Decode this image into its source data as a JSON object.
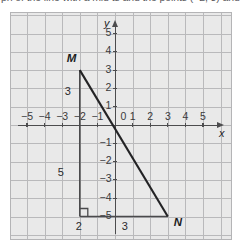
{
  "prompt": {
    "text_visible_fragment": "ph of the line with a mid ts and the points (−2, 3) and (3, −5)"
  },
  "figure": {
    "type": "coordinate-grid-graph",
    "colors": {
      "panel_background": "#e9e9e9",
      "gridline": "#b9b9bb",
      "axis": "#4c4c4e",
      "segment_hypotenuse": "#232325",
      "segment_leg": "#4a4a4c",
      "text": "#2b2b2d"
    },
    "axes": {
      "x_axis_name": "x",
      "y_axis_name": "y",
      "origin_label": "0",
      "x_tick_labels": [
        "−5",
        "−4",
        "−3",
        "−2",
        "−1",
        "1",
        "2",
        "3",
        "4",
        "5"
      ],
      "x_tick_values": [
        -5,
        -4,
        -3,
        -2,
        -1,
        1,
        2,
        3,
        4,
        5
      ],
      "y_tick_labels": [
        "5",
        "4",
        "3",
        "2",
        "1",
        "−1",
        "−2",
        "−3",
        "−4",
        "−5"
      ],
      "y_tick_values": [
        5,
        4,
        3,
        2,
        1,
        -1,
        -2,
        -3,
        -4,
        -5
      ],
      "xlim": [
        -5.85,
        5.85
      ],
      "ylim": [
        -5.85,
        6.0
      ],
      "grid": true,
      "grid_step": 1
    },
    "points": [
      {
        "name": "M",
        "label": "M",
        "x": -2,
        "y": 3
      },
      {
        "name": "N",
        "label": "N",
        "x": 3,
        "y": -5
      }
    ],
    "segments": [
      {
        "name": "hypotenuse-MN",
        "from": "M",
        "to": "N",
        "style": "heavy"
      },
      {
        "name": "vertical-leg",
        "from_x": -2,
        "from_y": 3,
        "to_x": -2,
        "to_y": -5,
        "style": "light"
      },
      {
        "name": "horizontal-leg",
        "from_x": -2,
        "from_y": -5,
        "to_x": 3,
        "to_y": -5,
        "style": "light"
      }
    ],
    "segment_labels": [
      {
        "name": "vertical-upper-label",
        "text": "3"
      },
      {
        "name": "vertical-lower-label",
        "text": "5"
      },
      {
        "name": "horizontal-left-label",
        "text": "2"
      },
      {
        "name": "horizontal-right-label",
        "text": "3"
      }
    ],
    "right_angle_marker": {
      "at_x": -2,
      "at_y": -5,
      "present": true
    }
  },
  "chart_data": {
    "type": "line",
    "title": "",
    "xlabel": "x",
    "ylabel": "y",
    "xlim": [
      -5.85,
      5.85
    ],
    "ylim": [
      -5.85,
      6.0
    ],
    "grid": true,
    "legend": "none",
    "series": [
      {
        "name": "segment MN",
        "points": [
          [
            -2,
            3
          ],
          [
            3,
            -5
          ]
        ],
        "annotations": [
          "M",
          "N"
        ]
      },
      {
        "name": "vertical leg",
        "points": [
          [
            -2,
            3
          ],
          [
            -2,
            -5
          ]
        ],
        "annotations": [
          "3",
          "5"
        ]
      },
      {
        "name": "horizontal leg",
        "points": [
          [
            -2,
            -5
          ],
          [
            3,
            -5
          ]
        ],
        "annotations": [
          "2",
          "3"
        ]
      }
    ],
    "xticks": [
      -5,
      -4,
      -3,
      -2,
      -1,
      0,
      1,
      2,
      3,
      4,
      5
    ],
    "yticks": [
      -5,
      -4,
      -3,
      -2,
      -1,
      0,
      1,
      2,
      3,
      4,
      5
    ]
  }
}
